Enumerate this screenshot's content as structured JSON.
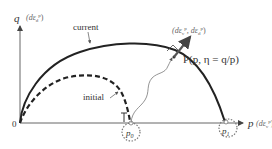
{
  "diagram": {
    "type": "yield-surface-schematic",
    "axes": {
      "y_label_symbol": "q",
      "y_label_suffix": "(dε",
      "y_label_sub": "d",
      "y_label_sup": "p",
      "y_label_close": ")",
      "x_label_symbol": "p",
      "x_label_suffix": "(dε",
      "x_label_sub": "v",
      "x_label_sup": "p",
      "x_label_close": ")",
      "origin_label": "0"
    },
    "curves": {
      "current_label": "current",
      "initial_label": "initial"
    },
    "points": {
      "state_point_label": "P(p, η = q/p)",
      "p0_label": "p",
      "p0_sub": "0",
      "p1_label": "p",
      "p1_sub": "1"
    },
    "vector": {
      "label": "(dε",
      "label_sub1": "v",
      "label_sup1": "p",
      "label_mid": ", dε",
      "label_sub2": "d",
      "label_sup2": "p",
      "label_close": ")"
    },
    "colors": {
      "curve": "#222222",
      "axis": "#666666",
      "arrow": "#555555",
      "text": "#333333",
      "circle": "#777777"
    }
  }
}
